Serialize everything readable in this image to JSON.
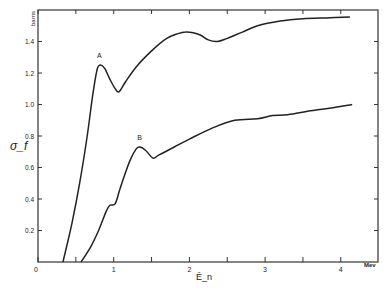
{
  "chart_data": {
    "type": "line",
    "title": "",
    "xlabel": "Ē_n",
    "x_unit": "Mev",
    "ylabel": "σ_f",
    "y_unit": "barns",
    "xlim": [
      0,
      4.5
    ],
    "ylim": [
      0,
      1.6
    ],
    "x_ticks": [
      0,
      0.5,
      1,
      1.5,
      2,
      2.5,
      3,
      3.5,
      4
    ],
    "x_tick_labels": [
      "0",
      "",
      "1",
      "",
      "2",
      "",
      "3",
      "",
      "4"
    ],
    "y_ticks": [
      0,
      0.2,
      0.4,
      0.6,
      0.8,
      1.0,
      1.2,
      1.4
    ],
    "y_tick_labels": [
      "0",
      "0.2",
      "0.4",
      "0.6",
      "0.8",
      "1.0",
      "1.2",
      "1.4"
    ],
    "grid": false,
    "legend": null,
    "series": [
      {
        "name": "A",
        "x": [
          0.33,
          0.45,
          0.55,
          0.65,
          0.72,
          0.78,
          0.82,
          0.88,
          0.95,
          1.02,
          1.07,
          1.15,
          1.3,
          1.5,
          1.7,
          1.85,
          1.95,
          2.05,
          2.15,
          2.25,
          2.37,
          2.5,
          2.7,
          2.9,
          3.2,
          3.5,
          3.8,
          4.12
        ],
        "values": [
          0.0,
          0.25,
          0.5,
          0.8,
          1.05,
          1.22,
          1.25,
          1.23,
          1.16,
          1.1,
          1.08,
          1.14,
          1.24,
          1.34,
          1.42,
          1.45,
          1.46,
          1.455,
          1.44,
          1.41,
          1.4,
          1.42,
          1.46,
          1.5,
          1.53,
          1.545,
          1.55,
          1.555
        ]
      },
      {
        "name": "B",
        "x": [
          0.57,
          0.7,
          0.8,
          0.9,
          0.95,
          1.02,
          1.08,
          1.15,
          1.22,
          1.3,
          1.35,
          1.42,
          1.52,
          1.6,
          1.8,
          2.0,
          2.3,
          2.6,
          2.9,
          3.1,
          3.3,
          3.6,
          3.9,
          4.15
        ],
        "values": [
          0.0,
          0.1,
          0.2,
          0.32,
          0.36,
          0.37,
          0.46,
          0.56,
          0.65,
          0.72,
          0.73,
          0.71,
          0.66,
          0.68,
          0.73,
          0.78,
          0.85,
          0.9,
          0.91,
          0.93,
          0.935,
          0.96,
          0.98,
          1.0
        ]
      }
    ],
    "annotations": [
      {
        "text": "A",
        "x": 0.82,
        "y": 1.28
      },
      {
        "text": "B",
        "x": 1.35,
        "y": 0.76
      }
    ]
  }
}
